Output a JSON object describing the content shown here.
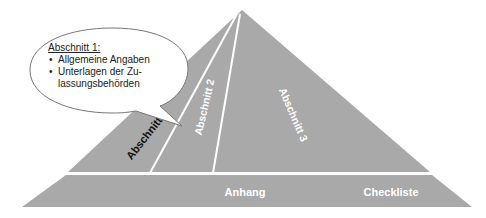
{
  "diagram": {
    "type": "pyramid",
    "colors": {
      "fill": "#a9a9a9",
      "divider": "#ffffff",
      "bubble_fill": "#ffffff",
      "bubble_stroke": "#777777"
    },
    "sections": [
      {
        "id": "abschnitt-1",
        "label": "Abschnitt 1",
        "text_color": "#111111"
      },
      {
        "id": "abschnitt-2",
        "label": "Abschnitt 2",
        "text_color": "#ffffff"
      },
      {
        "id": "abschnitt-3",
        "label": "Abschnitt 3",
        "text_color": "#ffffff"
      }
    ],
    "base_band": {
      "labels": [
        "Anhang",
        "Checkliste"
      ]
    },
    "callout": {
      "title": "Abschnitt 1:",
      "bullets": [
        {
          "line1": "Allgemeine Angaben"
        },
        {
          "line1": "Unterlagen der Zu-",
          "line2": "lassungsbehörden"
        }
      ],
      "bullet_char": "•"
    }
  }
}
